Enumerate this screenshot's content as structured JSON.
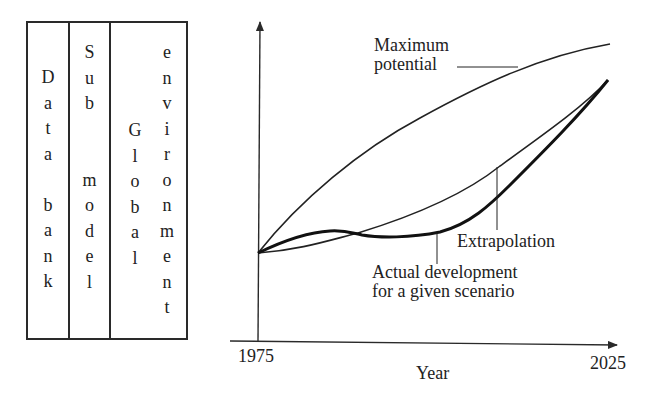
{
  "stack": {
    "columns": [
      {
        "label": "Data bank",
        "letters": [
          "D",
          "a",
          "t",
          "a",
          "",
          "b",
          "a",
          "n",
          "k"
        ]
      },
      {
        "label": "Sub model",
        "letters": [
          "S",
          "u",
          "b",
          "",
          "",
          "m",
          "o",
          "d",
          "e",
          "l"
        ]
      },
      {
        "label": "Global",
        "letters": [
          "G",
          "l",
          "o",
          "b",
          "a",
          "l"
        ]
      },
      {
        "label": "environment",
        "letters": [
          "e",
          "n",
          "v",
          "i",
          "r",
          "o",
          "n",
          "m",
          "e",
          "n",
          "t"
        ]
      }
    ]
  },
  "chart_data": {
    "type": "line",
    "title": "",
    "xlabel": "Year",
    "ylabel": "",
    "x_ticks": [
      "1975",
      "2025"
    ],
    "xlim": [
      1975,
      2025
    ],
    "grid": false,
    "series": [
      {
        "name": "Maximum potential",
        "x": [
          1975,
          1985,
          1995,
          2005,
          2015,
          2025
        ],
        "y": [
          0.0,
          0.4,
          0.66,
          0.83,
          0.93,
          1.0
        ],
        "style": "thin"
      },
      {
        "name": "Extrapolation",
        "x": [
          1975,
          1985,
          1995,
          2005,
          2015,
          2025
        ],
        "y": [
          0.0,
          0.07,
          0.2,
          0.36,
          0.55,
          0.83
        ],
        "style": "thin"
      },
      {
        "name": "Actual development for a given scenario",
        "x": [
          1975,
          1980,
          1985,
          1990,
          1995,
          2005,
          2015,
          2025
        ],
        "y": [
          0.0,
          0.09,
          0.12,
          0.09,
          0.08,
          0.16,
          0.38,
          0.83
        ],
        "style": "bold"
      }
    ],
    "annotations": [
      {
        "text": "Maximum potential",
        "target": "Maximum potential"
      },
      {
        "text": "Extrapolation",
        "target": "Extrapolation"
      },
      {
        "text": "Actual development for a given scenario",
        "target": "Actual development for a given scenario"
      }
    ]
  },
  "labels": {
    "max_line1": "Maximum",
    "max_line2": "potential",
    "extrapolation": "Extrapolation",
    "actual_line1": "Actual development",
    "actual_line2": "for a given scenario",
    "x_start": "1975",
    "x_end": "2025",
    "x_axis": "Year"
  }
}
